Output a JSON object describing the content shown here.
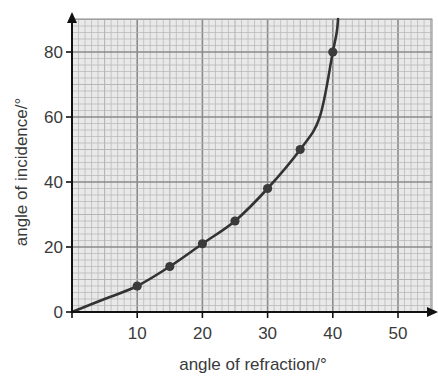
{
  "chart_data": {
    "type": "line",
    "title": "",
    "xlabel": "angle of refraction/°",
    "ylabel": "angle of incidence/°",
    "xlim": [
      0,
      55
    ],
    "ylim": [
      0,
      90
    ],
    "x_ticks": [
      10,
      20,
      30,
      40,
      50
    ],
    "y_ticks": [
      0,
      20,
      40,
      60,
      80
    ],
    "grid": true,
    "legend": null,
    "series": [
      {
        "name": "measured points",
        "style": "markers",
        "x": [
          10,
          15,
          20,
          25,
          30,
          35,
          40
        ],
        "y": [
          8,
          14,
          21,
          28,
          38,
          50,
          80
        ]
      },
      {
        "name": "best-fit curve",
        "style": "smooth line",
        "x": [
          0,
          5,
          10,
          15,
          20,
          25,
          30,
          35,
          38,
          40,
          40.6,
          40.8
        ],
        "y": [
          0,
          4,
          8,
          14,
          21,
          28,
          38,
          50,
          60,
          80,
          86,
          90
        ]
      }
    ]
  },
  "colors": {
    "grid_fill": "#e9e9e9",
    "grid_minor": "#b5b5b5",
    "grid_major": "#8a8a8a",
    "axis": "#111111",
    "curve": "#333333",
    "marker": "#3a3a3a"
  }
}
